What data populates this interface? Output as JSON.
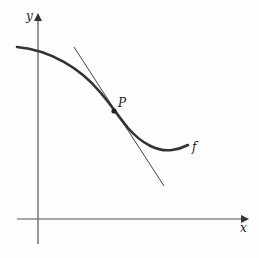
{
  "figure": {
    "labels": {
      "y_axis": "y",
      "x_axis": "x",
      "point": "P",
      "function": "f"
    },
    "colors": {
      "curve": "#333333",
      "tangent": "#444444",
      "axes": "#555555"
    }
  }
}
